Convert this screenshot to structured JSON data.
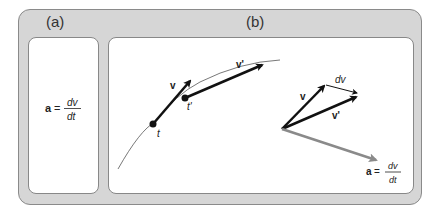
{
  "panel_a": {
    "label": "(a)",
    "equation": {
      "lhs": "a",
      "eq": "=",
      "num": "dv",
      "den": "dt"
    }
  },
  "panel_b": {
    "label": "(b)",
    "curve_labels": {
      "v": "v",
      "v_prime": "v'",
      "t": "t",
      "t_prime": "t'"
    },
    "vector_labels": {
      "v": "v",
      "v_prime": "v'",
      "dv": "dv"
    },
    "equation": {
      "lhs": "a",
      "eq": "=",
      "num": "dv",
      "den": "dt"
    }
  },
  "colors": {
    "frame": "#d6d6d6",
    "accel_arrow": "#8a8a8a",
    "vector": "#111111"
  }
}
